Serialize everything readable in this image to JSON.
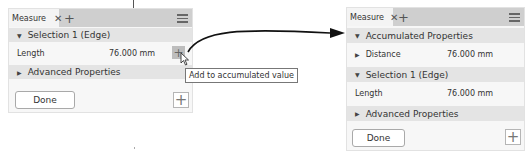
{
  "left_panel": {
    "tab_label": "Measure",
    "close_glyph": "✕",
    "add_tab_glyph": "+",
    "selection_header": "Selection 1 (Edge)",
    "length_label": "Length",
    "length_value": "76.000 mm",
    "add_row_glyph": "+",
    "advanced_header": "Advanced Properties",
    "done_label": "Done",
    "plus_glyph": "+",
    "tooltip": "Add to accumulated value"
  },
  "right_panel": {
    "tab_label": "Measure",
    "close_glyph": "✕",
    "add_tab_glyph": "+",
    "accumulated_header": "Accumulated Properties",
    "distance_label": "Distance",
    "distance_value": "76.000 mm",
    "selection_header": "Selection 1 (Edge)",
    "length_label": "Length",
    "length_value": "76.000 mm",
    "advanced_header": "Advanced Properties",
    "done_label": "Done",
    "plus_glyph": "+"
  },
  "glyphs": {
    "expanded": "▼",
    "collapsed": "▶"
  }
}
